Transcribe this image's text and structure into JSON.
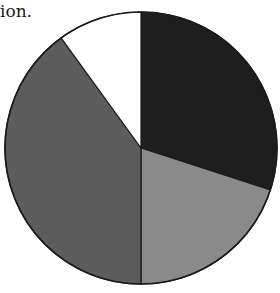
{
  "text": {
    "caption_fragment": "ion."
  },
  "chart_data": {
    "type": "pie",
    "title": "",
    "start_angle": "12 o'clock",
    "direction": "clockwise",
    "legend": "none",
    "labels": [
      "Slice 1",
      "Slice 2",
      "Slice 3",
      "Slice 4"
    ],
    "values": [
      30,
      20,
      40,
      10
    ],
    "colors": [
      "#1e1e1e",
      "#8a8a8a",
      "#5c5c5c",
      "#ffffff"
    ],
    "outline_color": "#1a1a1a"
  },
  "geometry": {
    "cx": 141,
    "cy": 148,
    "r": 136
  }
}
